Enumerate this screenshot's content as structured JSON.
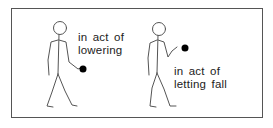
{
  "figures": [
    {
      "id": "lowering",
      "label_lines": [
        "in act of",
        "lowering"
      ]
    },
    {
      "id": "letting-fall",
      "label_lines": [
        "in act of",
        "letting fall"
      ]
    }
  ],
  "colors": {
    "line": "#555555",
    "ball": "#000000",
    "text": "#222222",
    "border": "#555555"
  }
}
